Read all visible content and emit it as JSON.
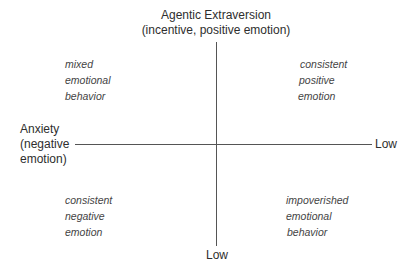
{
  "diagram": {
    "title": "",
    "axes": {
      "vertical": {
        "top_label_line1": "Agentic Extraversion",
        "top_label_line2": "(incentive, positive emotion)",
        "bottom_label": "Low"
      },
      "horizontal": {
        "left_label_line1": "Anxiety",
        "left_label_line2": "(negative",
        "left_label_line3": "emotion)",
        "right_label": "Low"
      }
    },
    "quadrants": {
      "top_left": [
        "mixed",
        "emotional",
        "behavior"
      ],
      "top_right": [
        "consistent",
        "positive",
        "emotion"
      ],
      "bottom_left": [
        "consistent",
        "negative",
        "emotion"
      ],
      "bottom_right": [
        "impoverished",
        "emotional",
        "behavior"
      ]
    },
    "colors": {
      "line": "#555555",
      "text": "#2e2e2e",
      "quadrant_text": "#444444",
      "background": "#ffffff"
    }
  }
}
